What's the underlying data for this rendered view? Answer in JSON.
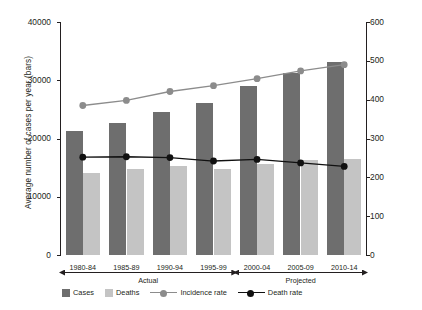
{
  "chart_data": {
    "type": "bar",
    "title": "",
    "categories": [
      "1980-84",
      "1985-89",
      "1990-94",
      "1995-99",
      "2000-04",
      "2005-09",
      "2010-14"
    ],
    "phases": [
      {
        "label": "Actual",
        "from": "1980-84",
        "to": "1995-99"
      },
      {
        "label": "Projected",
        "from": "2000-04",
        "to": "2010-14"
      }
    ],
    "xlabel": "",
    "ylabel": "Average number of cases per year (bars)",
    "ylabel_right": "Age standardised rate per 100,000 population (lines)",
    "ylim": [
      0,
      40000
    ],
    "ylim_right": [
      0,
      600
    ],
    "yticks": [
      "0",
      "10000",
      "20000",
      "30000",
      "40000"
    ],
    "yticks_right": [
      "0",
      "100",
      "200",
      "300",
      "400",
      "500",
      "600"
    ],
    "grid": false,
    "legend_position": "bottom",
    "series": [
      {
        "name": "Cases",
        "type": "bar",
        "axis": "left",
        "color": "#6e6e6e",
        "values": [
          21300,
          22600,
          24600,
          26100,
          29000,
          31200,
          33100
        ]
      },
      {
        "name": "Deaths",
        "type": "bar",
        "axis": "left",
        "color": "#c4c4c4",
        "values": [
          14100,
          14700,
          15200,
          14800,
          15700,
          16300,
          16400
        ]
      },
      {
        "name": "Incidence rate",
        "type": "line",
        "axis": "right",
        "color": "#8c8c8c",
        "values": [
          385,
          398,
          421,
          436,
          454,
          474,
          490
        ]
      },
      {
        "name": "Death rate",
        "type": "line",
        "axis": "right",
        "color": "#111111",
        "values": [
          252,
          253,
          251,
          242,
          246,
          237,
          228
        ]
      }
    ]
  },
  "legend": {
    "items": [
      {
        "label": "Cases",
        "kind": "swatch",
        "color": "#6e6e6e"
      },
      {
        "label": "Deaths",
        "kind": "swatch",
        "color": "#c4c4c4"
      },
      {
        "label": "Incidence rate",
        "kind": "line",
        "color": "#8c8c8c"
      },
      {
        "label": "Death rate",
        "kind": "line",
        "color": "#111111"
      }
    ]
  }
}
